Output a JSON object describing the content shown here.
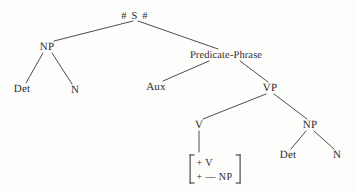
{
  "figure": {
    "type": "syntax-tree",
    "title": "",
    "background_color": "#fdfdfc",
    "line_color": "#3a3a3a",
    "text_color": "#2b2b2b"
  },
  "nodes": {
    "root": {
      "label": "# S #",
      "x": 135,
      "y": 16
    },
    "np_subject": {
      "label": "NP",
      "x": 47,
      "y": 47
    },
    "predicate_phrase": {
      "label": "Predicate-Phrase",
      "x": 226,
      "y": 55
    },
    "det_left": {
      "label": "Det",
      "x": 22,
      "y": 89
    },
    "n_left": {
      "label": "N",
      "x": 75,
      "y": 90
    },
    "aux": {
      "label": "Aux",
      "x": 156,
      "y": 87
    },
    "vp": {
      "label": "VP",
      "x": 270,
      "y": 88
    },
    "v": {
      "label": "V",
      "x": 199,
      "y": 125
    },
    "np_object": {
      "label": "NP",
      "x": 310,
      "y": 125
    },
    "det_right": {
      "label": "Det",
      "x": 288,
      "y": 155
    },
    "n_right": {
      "label": "N",
      "x": 337,
      "y": 155
    }
  },
  "feature_matrix": {
    "x": 215,
    "y": 169,
    "open_bracket": "[",
    "close_bracket": "]",
    "rows": [
      "+ V",
      "+ — NP"
    ]
  },
  "edges": [
    {
      "from": "root",
      "to": "np_subject"
    },
    {
      "from": "root",
      "to": "predicate_phrase"
    },
    {
      "from": "np_subject",
      "to": "det_left"
    },
    {
      "from": "np_subject",
      "to": "n_left"
    },
    {
      "from": "predicate_phrase",
      "to": "aux"
    },
    {
      "from": "predicate_phrase",
      "to": "vp"
    },
    {
      "from": "vp",
      "to": "v"
    },
    {
      "from": "vp",
      "to": "np_object"
    },
    {
      "from": "v",
      "to": "feature_matrix"
    },
    {
      "from": "np_object",
      "to": "det_right"
    },
    {
      "from": "np_object",
      "to": "n_right"
    }
  ]
}
